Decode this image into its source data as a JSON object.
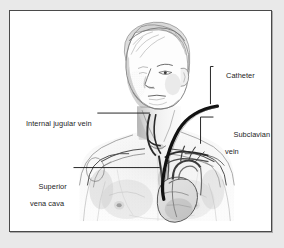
{
  "figure": {
    "type": "medical-illustration",
    "view": "anterior view of male head, neck, shoulders and chest with internal venous anatomy and heart shown",
    "style": "grayscale pencil / stipple line drawing",
    "frame": {
      "border_color": "#4a4a4a",
      "background_color": "#ffffff",
      "page_background_color": "#e9e9e9"
    },
    "line_color": "#1c1c1c",
    "catheter_color": "#141414"
  },
  "labels": {
    "catheter": "Catheter",
    "subclavian_vein_line1": "Subclavian",
    "subclavian_vein_line2": "vein",
    "internal_jugular_vein": "Internal jugular vein",
    "superior_vena_cava_line1": "Superior",
    "superior_vena_cava_line2": "vena cava"
  },
  "leaders": [
    {
      "name": "catheter-leader",
      "label": "Catheter",
      "from": "label left edge",
      "path": "horizontal left then vertical down to catheter tip"
    },
    {
      "name": "subclavian-vein-leader",
      "label": "Subclavian vein",
      "path": "horizontal left then vertical down to subclavian vein"
    },
    {
      "name": "internal-jugular-vein-leader",
      "label": "Internal jugular vein",
      "path": "horizontal right to vein in neck"
    },
    {
      "name": "superior-vena-cava-leader",
      "label": "Superior vena cava",
      "path": "horizontal right to vena cava above heart"
    }
  ]
}
